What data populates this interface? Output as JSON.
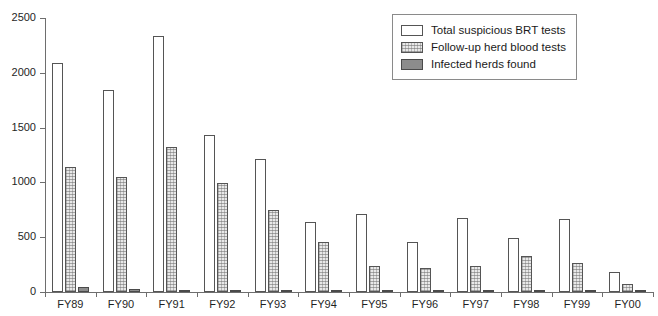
{
  "chart_data": {
    "type": "bar",
    "title": "",
    "xlabel": "",
    "ylabel": "",
    "ylim": [
      0,
      2500
    ],
    "yticks": [
      0,
      500,
      1000,
      1500,
      2000,
      2500
    ],
    "ytick_labels": [
      "0",
      "500",
      "1000",
      "1500",
      "2000",
      "2500"
    ],
    "grid": false,
    "legend_position": "top-right",
    "categories": [
      "FY89",
      "FY90",
      "FY91",
      "FY92",
      "FY93",
      "FY94",
      "FY95",
      "FY96",
      "FY97",
      "FY98",
      "FY99",
      "FY00"
    ],
    "series": [
      {
        "name": "Total suspicious BRT tests",
        "style": "white-filled",
        "color": "#ffffff",
        "values": [
          2090,
          1845,
          2335,
          1430,
          1210,
          640,
          715,
          455,
          675,
          490,
          665,
          185
        ]
      },
      {
        "name": "Follow-up herd blood tests",
        "style": "stippled",
        "color": "#e8e8e8",
        "values": [
          1140,
          1045,
          1325,
          995,
          745,
          460,
          235,
          215,
          235,
          330,
          265,
          75
        ]
      },
      {
        "name": "Infected herds found",
        "style": "solid-gray",
        "color": "#8c8c8c",
        "values": [
          50,
          25,
          22,
          10,
          12,
          8,
          5,
          4,
          3,
          3,
          2,
          1
        ]
      }
    ]
  },
  "axis": {
    "line_color": "#6e6e6e"
  }
}
